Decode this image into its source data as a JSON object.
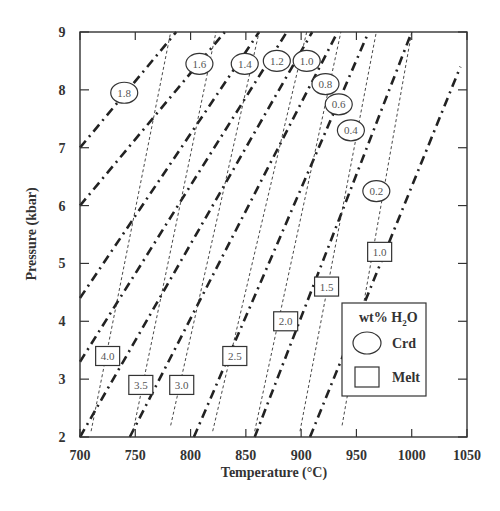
{
  "chart_data": {
    "type": "line",
    "title": "",
    "xlabel": "Temperature (°C)",
    "ylabel": "Pressure (kbar)",
    "xlim": [
      700,
      1050
    ],
    "ylim": [
      2,
      9
    ],
    "x_ticks": [
      "700",
      "750",
      "800",
      "850",
      "900",
      "950",
      "1000",
      "1050"
    ],
    "y_ticks": [
      "2",
      "3",
      "4",
      "5",
      "6",
      "7",
      "8",
      "9"
    ],
    "grid": false,
    "legend": {
      "title": "wt% H2O",
      "position": "lower right",
      "entries": [
        {
          "symbol": "ellipse",
          "label": "Crd"
        },
        {
          "symbol": "rectangle",
          "label": "Melt"
        }
      ]
    },
    "series": [
      {
        "name": "Crd 1.8",
        "group": "Crd",
        "style": "dash-dot",
        "points": [
          [
            700,
            7.0
          ],
          [
            787,
            9.0
          ]
        ],
        "label_at": [
          740,
          7.95
        ]
      },
      {
        "name": "Crd 1.6",
        "group": "Crd",
        "style": "dash-dot",
        "points": [
          [
            700,
            6.0
          ],
          [
            831,
            9.0
          ]
        ],
        "label_at": [
          808,
          8.45
        ]
      },
      {
        "name": "Crd 1.4",
        "group": "Crd",
        "style": "dash-dot",
        "points": [
          [
            700,
            4.4
          ],
          [
            862,
            9.0
          ]
        ],
        "label_at": [
          849,
          8.45
        ]
      },
      {
        "name": "Crd 1.2",
        "group": "Crd",
        "style": "dash-dot",
        "points": [
          [
            700,
            3.3
          ],
          [
            887,
            9.0
          ]
        ],
        "label_at": [
          878,
          8.5
        ]
      },
      {
        "name": "Crd 1.0",
        "group": "Crd",
        "style": "dash-dot",
        "points": [
          [
            700,
            2.0
          ],
          [
            910,
            9.0
          ]
        ],
        "label_at": [
          905,
          8.5
        ]
      },
      {
        "name": "Crd 0.8",
        "group": "Crd",
        "style": "dash-dot",
        "points": [
          [
            745,
            2.0
          ],
          [
            933,
            9.0
          ]
        ],
        "label_at": [
          922,
          8.1
        ]
      },
      {
        "name": "Crd 0.6",
        "group": "Crd",
        "style": "dash-dot",
        "points": [
          [
            803,
            2.0
          ],
          [
            961,
            9.0
          ]
        ],
        "label_at": [
          934,
          7.75
        ]
      },
      {
        "name": "Crd 0.4",
        "group": "Crd",
        "style": "dash-dot",
        "points": [
          [
            858,
            2.0
          ],
          [
            1000,
            9.0
          ]
        ],
        "label_at": [
          945,
          7.3
        ]
      },
      {
        "name": "Crd 0.2",
        "group": "Crd",
        "style": "dash-dot",
        "points": [
          [
            908,
            2.0
          ],
          [
            1044,
            8.4
          ]
        ],
        "label_at": [
          968,
          6.25
        ]
      },
      {
        "name": "Melt 4.0",
        "group": "Melt",
        "style": "dashed",
        "points": [
          [
            710,
            2.1
          ],
          [
            782,
            9.0
          ]
        ],
        "label_at": [
          725,
          3.4
        ]
      },
      {
        "name": "Melt 3.5",
        "group": "Melt",
        "style": "dashed",
        "points": [
          [
            748,
            2.1
          ],
          [
            823,
            9.0
          ]
        ],
        "label_at": [
          755,
          2.9
        ]
      },
      {
        "name": "Melt 3.0",
        "group": "Melt",
        "style": "dashed",
        "points": [
          [
            782,
            2.2
          ],
          [
            862,
            9.0
          ]
        ],
        "label_at": [
          792,
          2.9
        ]
      },
      {
        "name": "Melt 2.5",
        "group": "Melt",
        "style": "dashed",
        "points": [
          [
            820,
            2.1
          ],
          [
            905,
            9.0
          ]
        ],
        "label_at": [
          840,
          3.4
        ]
      },
      {
        "name": "Melt 2.0",
        "group": "Melt",
        "style": "dashed",
        "points": [
          [
            858,
            2.1
          ],
          [
            936,
            9.0
          ]
        ],
        "label_at": [
          886,
          4.0
        ]
      },
      {
        "name": "Melt 1.5",
        "group": "Melt",
        "style": "dashed",
        "points": [
          [
            899,
            2.1
          ],
          [
            968,
            9.0
          ]
        ],
        "label_at": [
          923,
          4.6
        ]
      },
      {
        "name": "Melt 1.0",
        "group": "Melt",
        "style": "dashed",
        "points": [
          [
            937,
            2.2
          ],
          [
            1000,
            9.0
          ]
        ],
        "label_at": [
          971,
          5.2
        ]
      }
    ],
    "crd_labels": [
      "1.8",
      "1.6",
      "1.4",
      "1.2",
      "1.0",
      "0.8",
      "0.6",
      "0.4",
      "0.2"
    ],
    "melt_labels": [
      "4.0",
      "3.5",
      "3.0",
      "2.5",
      "2.0",
      "1.5",
      "1.0"
    ]
  },
  "legend": {
    "title_main": "wt% H",
    "title_sub": "2",
    "title_end": "O",
    "crd": "Crd",
    "melt": "Melt"
  },
  "axes": {
    "xlabel": "Temperature (°C)",
    "ylabel": "Pressure (kbar)"
  }
}
